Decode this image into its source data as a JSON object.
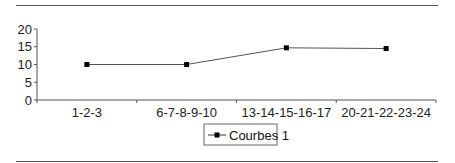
{
  "chart_data": {
    "type": "line",
    "title": "",
    "xlabel": "",
    "ylabel": "",
    "categories": [
      "1-2-3",
      "6-7-8-9-10",
      "13-14-15-16-17",
      "20-21-22-23-24"
    ],
    "series": [
      {
        "name": "Courbes 1",
        "values": [
          10,
          10,
          14.7,
          14.5
        ],
        "color": "#000000",
        "marker": "square"
      }
    ],
    "ylim": [
      0,
      20
    ],
    "yticks": [
      0,
      5,
      10,
      15,
      20
    ],
    "grid": false,
    "legend_position": "bottom"
  },
  "colors": {
    "line": "#555555",
    "marker": "#000000",
    "axis": "#555555",
    "rule": "#555555"
  }
}
